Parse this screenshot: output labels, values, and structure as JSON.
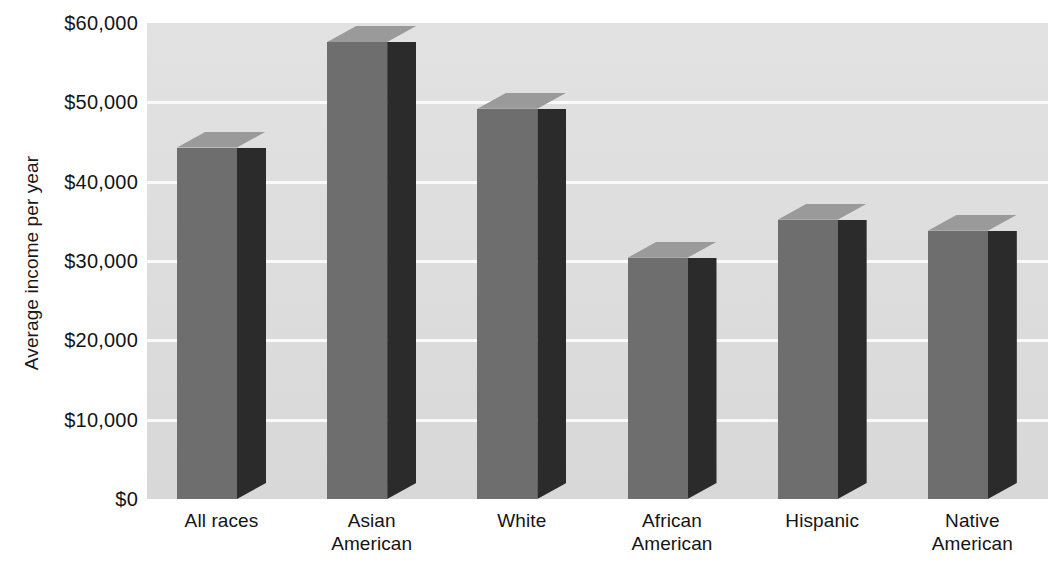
{
  "chart_data": {
    "type": "bar",
    "title": "",
    "subtitle": "",
    "xlabel": "",
    "ylabel": "Average income per year",
    "categories": [
      "All races",
      "Asian\nAmerican",
      "White",
      "African\nAmerican",
      "Hispanic",
      "Native\nAmerican"
    ],
    "values": [
      44300,
      57600,
      49200,
      30400,
      35200,
      33800
    ],
    "ylim": [
      0,
      60000
    ],
    "ytick_values": [
      0,
      10000,
      20000,
      30000,
      40000,
      50000,
      60000
    ],
    "ytick_labels": [
      "$0",
      "$10,000",
      "$20,000",
      "$30,000",
      "$40,000",
      "$50,000",
      "$60,000"
    ],
    "grid": true,
    "legend": "none",
    "style": "3d-column",
    "colors": {
      "bar_front": "#6e6e6e",
      "bar_side": "#2b2b2b",
      "bar_top": "#9a9a9a",
      "plot_background": "#dedede",
      "gridline": "#fafafa",
      "text": "#141414",
      "page_background": "#ffffff"
    }
  }
}
